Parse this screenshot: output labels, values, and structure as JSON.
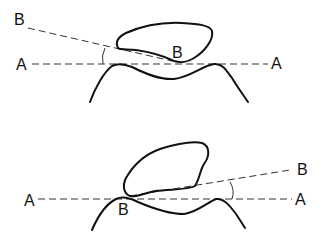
{
  "diagram": {
    "type": "angle-measurement-illustration",
    "colors": {
      "line": "#111111",
      "background": "#ffffff"
    },
    "panels": [
      {
        "id": "top",
        "labels": {
          "line_b_end": "B",
          "line_a_left": "A",
          "line_a_right": "A",
          "contact_point": "B"
        },
        "description": "Line B-B tilted downward-right relative to horizontal line A-A; angle marked on left"
      },
      {
        "id": "bottom",
        "labels": {
          "line_a_left": "A",
          "line_a_right": "A",
          "line_b_end": "B",
          "contact_point": "B"
        },
        "description": "Line B-B tilted upward-right relative to horizontal line A-A; angle marked on right"
      }
    ]
  }
}
